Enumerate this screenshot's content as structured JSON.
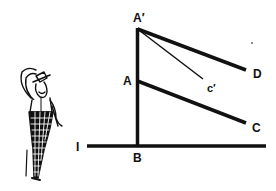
{
  "diagram": {
    "colors": {
      "ink": "#111111",
      "background": "#ffffff"
    },
    "labels": {
      "a_prime": "A′",
      "a": "A",
      "c_prime": "c′",
      "d": "D",
      "c": "C",
      "b": "B",
      "i": "I"
    },
    "figure": {
      "description": "cartoon man in top hat and checkered trousers scratching head"
    }
  }
}
